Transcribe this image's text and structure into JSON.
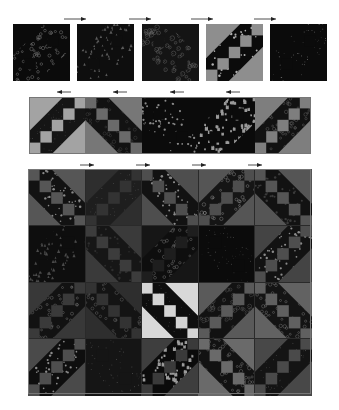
{
  "diagram": {
    "type": "quilt-block-assembly",
    "background": "#ffffff",
    "colors": {
      "black": "#0b0b0b",
      "dark": "#1c1c1c",
      "mid": "#4a4a4a",
      "gray": "#6e6e6e",
      "light": "#9a9a9a",
      "pale": "#c8c8c8",
      "white": "#e6e6e6",
      "dot": "#8a8a8a",
      "grid_line": "#2a2a2a",
      "arrow": "#222222"
    },
    "top_row": {
      "arrow_direction": "right",
      "arrows": [
        {
          "x": 64,
          "y": 19,
          "w": 22
        },
        {
          "x": 129,
          "y": 19,
          "w": 22
        },
        {
          "x": 191,
          "y": 19,
          "w": 22
        },
        {
          "x": 254,
          "y": 19,
          "w": 22
        }
      ],
      "blocks": [
        {
          "x": 13,
          "y": 24,
          "w": 57,
          "h": 57,
          "kind": "print",
          "orient": "a",
          "base": "#0b0b0b",
          "motif": "#8a8a8a",
          "shape": "ring"
        },
        {
          "x": 77,
          "y": 24,
          "w": 57,
          "h": 57,
          "kind": "print",
          "orient": "a",
          "base": "#0e0e0e",
          "motif": "#5a5a5a",
          "shape": "tri"
        },
        {
          "x": 142,
          "y": 24,
          "w": 57,
          "h": 57,
          "kind": "print",
          "orient": "b",
          "base": "#141414",
          "motif": "#7a7a7a",
          "shape": "swirl"
        },
        {
          "x": 206,
          "y": 24,
          "w": 57,
          "h": 57,
          "kind": "ladder",
          "orient": "a",
          "band": "#0b0b0b",
          "square": "#8e8e8e",
          "tri": "#8e8e8e",
          "motif": "#b0b0b0",
          "shape": "dot"
        },
        {
          "x": 270,
          "y": 24,
          "w": 57,
          "h": 57,
          "kind": "print",
          "orient": "a",
          "base": "#0b0b0b",
          "motif": "#7e7e7e",
          "shape": "speck"
        }
      ]
    },
    "middle_row": {
      "arrow_direction": "left",
      "arrows": [
        {
          "x": 57,
          "y": 92,
          "w": 14
        },
        {
          "x": 113,
          "y": 92,
          "w": 14
        },
        {
          "x": 170,
          "y": 92,
          "w": 14
        },
        {
          "x": 226,
          "y": 92,
          "w": 14
        }
      ],
      "frame": {
        "x": 29,
        "y": 97,
        "w": 282,
        "h": 57
      },
      "blocks": [
        {
          "x": 29,
          "y": 97,
          "w": 57,
          "h": 57,
          "kind": "ladder",
          "orient": "a",
          "band": "#151515",
          "square": "#a3a3a3",
          "tri": "#a3a3a3",
          "motif": "#5a5a5a",
          "shape": "speck"
        },
        {
          "x": 85,
          "y": 97,
          "w": 57,
          "h": 57,
          "kind": "ladder",
          "orient": "b",
          "band": "#121212",
          "square": "#6a6a6a",
          "tri": "#777777",
          "motif": "#4a4a4a",
          "shape": "ring"
        },
        {
          "x": 142,
          "y": 97,
          "w": 57,
          "h": 57,
          "kind": "print",
          "orient": "b",
          "base": "#0b0b0b",
          "motif": "#8a8a8a",
          "shape": "dot"
        },
        {
          "x": 198,
          "y": 97,
          "w": 57,
          "h": 57,
          "kind": "print",
          "orient": "a",
          "base": "#0b0b0b",
          "motif": "#9a9a9a",
          "shape": "cat"
        },
        {
          "x": 255,
          "y": 97,
          "w": 56,
          "h": 57,
          "kind": "ladder",
          "orient": "a",
          "band": "#121212",
          "square": "#7e7e7e",
          "tri": "#7e7e7e",
          "motif": "#6a6a6a",
          "shape": "ring"
        }
      ]
    },
    "bottom_grid": {
      "arrow_direction": "right",
      "arrows": [
        {
          "x": 80,
          "y": 165,
          "w": 14
        },
        {
          "x": 136,
          "y": 165,
          "w": 14
        },
        {
          "x": 192,
          "y": 165,
          "w": 14
        },
        {
          "x": 248,
          "y": 165,
          "w": 14
        }
      ],
      "frame": {
        "x": 28,
        "y": 169,
        "w": 283,
        "h": 225
      },
      "origin": {
        "x": 28,
        "y": 169
      },
      "cell": {
        "w": 56.6,
        "h": 56.25
      },
      "rows": [
        [
          {
            "kind": "ladder",
            "orient": "b",
            "band": "#121212",
            "square": "#565656",
            "tri": "#565656",
            "motif": "#8a8a8a",
            "shape": "dot"
          },
          {
            "kind": "ladder",
            "orient": "a",
            "band": "#1e1e1e",
            "square": "#333333",
            "tri": "#2e2e2e",
            "motif": "#5a5a5a",
            "shape": "speck"
          },
          {
            "kind": "ladder",
            "orient": "b",
            "band": "#121212",
            "square": "#4e4e4e",
            "tri": "#4e4e4e",
            "motif": "#8a8a8a",
            "shape": "dot"
          },
          {
            "kind": "ladder",
            "orient": "a",
            "band": "#151515",
            "square": "#4e4e4e",
            "tri": "#555555",
            "motif": "#8e8e8e",
            "shape": "ring"
          },
          {
            "kind": "ladder",
            "orient": "b",
            "band": "#121212",
            "square": "#555555",
            "tri": "#555555",
            "motif": "#3a3a3a",
            "shape": "dot"
          }
        ],
        [
          {
            "kind": "print",
            "orient": "a",
            "base": "#0e0e0e",
            "motif": "#4a4a4a",
            "shape": "tri"
          },
          {
            "kind": "ladder",
            "orient": "b",
            "band": "#161616",
            "square": "#3c3c3c",
            "tri": "#3a3a3a",
            "motif": "#2e2e2e",
            "shape": "dot"
          },
          {
            "kind": "ladder",
            "orient": "a",
            "band": "#0e0e0e",
            "square": "#1e1e1e",
            "tri": "#161616",
            "motif": "#7a7a7a",
            "shape": "ring"
          },
          {
            "kind": "print",
            "orient": "b",
            "base": "#0b0b0b",
            "motif": "#5a5a5a",
            "shape": "speck"
          },
          {
            "kind": "ladder",
            "orient": "a",
            "band": "#121212",
            "square": "#4e4e4e",
            "tri": "#444444",
            "motif": "#8a8a8a",
            "shape": "dot"
          }
        ],
        [
          {
            "kind": "ladder",
            "orient": "a",
            "band": "#121212",
            "square": "#3a3a3a",
            "tri": "#383838",
            "motif": "#7a7a7a",
            "shape": "ring"
          },
          {
            "kind": "ladder",
            "orient": "b",
            "band": "#141414",
            "square": "#333333",
            "tri": "#2e2e2e",
            "motif": "#6a6a6a",
            "shape": "ring"
          },
          {
            "kind": "ladder",
            "orient": "b",
            "band": "#0e0e0e",
            "square": "#d4d4d4",
            "tri": "#d8d8d8",
            "motif": "#4a4a4a",
            "shape": "speck"
          },
          {
            "kind": "ladder",
            "orient": "a",
            "band": "#121212",
            "square": "#5a5a5a",
            "tri": "#5a5a5a",
            "motif": "#6a6a6a",
            "shape": "swirl"
          },
          {
            "kind": "ladder",
            "orient": "b",
            "band": "#141414",
            "square": "#606060",
            "tri": "#626262",
            "motif": "#7a7a7a",
            "shape": "ring"
          }
        ],
        [
          {
            "kind": "ladder",
            "orient": "a",
            "band": "#0e0e0e",
            "square": "#4e4e4e",
            "tri": "#4a4a4a",
            "motif": "#8a8a8a",
            "shape": "dot"
          },
          {
            "kind": "print",
            "orient": "b",
            "base": "#151515",
            "motif": "#5a5a5a",
            "shape": "speck"
          },
          {
            "kind": "ladder",
            "orient": "a",
            "band": "#0b0b0b",
            "square": "#3a3a3a",
            "tri": "#3e3e3e",
            "motif": "#9a9a9a",
            "shape": "cat"
          },
          {
            "kind": "ladder",
            "orient": "b",
            "band": "#121212",
            "square": "#6a6a6a",
            "tri": "#6a6a6a",
            "motif": "#7a7a7a",
            "shape": "ring"
          },
          {
            "kind": "ladder",
            "orient": "a",
            "band": "#141414",
            "square": "#4a4a4a",
            "tri": "#484848",
            "motif": "#5a5a5a",
            "shape": "speck"
          }
        ]
      ]
    }
  }
}
